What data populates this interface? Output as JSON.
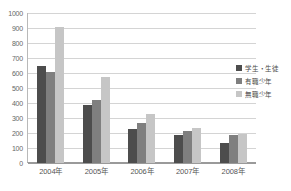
{
  "chart_data": {
    "type": "bar",
    "title": "",
    "subtitle": "",
    "xlabel": "",
    "ylabel": "",
    "categories": [
      "2004年",
      "2005年",
      "2006年",
      "2007年",
      "2008年"
    ],
    "series": [
      {
        "name": "学生・生徒",
        "color": "#4d4d4d",
        "values": [
          645,
          385,
          225,
          190,
          135
        ]
      },
      {
        "name": "有職少年",
        "color": "#7f7f7f",
        "values": [
          605,
          420,
          265,
          215,
          190
        ]
      },
      {
        "name": "無職少年",
        "color": "#c6c6c6",
        "values": [
          910,
          575,
          330,
          235,
          195
        ]
      }
    ],
    "ylim": [
      0,
      1000
    ],
    "ytick_step": 100,
    "yticks": [
      1000,
      900,
      800,
      700,
      600,
      500,
      400,
      300,
      200,
      100,
      0
    ],
    "ytick_labels": [
      "1000",
      "900",
      "800",
      "700",
      "600",
      "500",
      "400",
      "300",
      "200",
      "100",
      "0"
    ],
    "grid": true,
    "grid_axis": "y",
    "legend_position": "right",
    "legend": [
      "学生・生徒",
      "有職少年",
      "無職少年"
    ],
    "annotations": []
  },
  "colors": {
    "series_0": "#4d4d4d",
    "series_1": "#7f7f7f",
    "series_2": "#c6c6c6",
    "gridline": "#d4d4d4",
    "axis": "#9a9a9a",
    "background": "#ffffff",
    "tick_text": "#666666"
  }
}
